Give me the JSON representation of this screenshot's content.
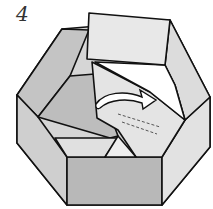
{
  "diagram": {
    "step_number": "4",
    "colors": {
      "outline": "#111111",
      "light_face": "#e6e6e6",
      "mid_face": "#c8c8c8",
      "dark_face": "#b0b0b0",
      "white": "#ffffff"
    },
    "icons": [
      "curved-arrow-icon",
      "dashed-fold-line"
    ]
  }
}
